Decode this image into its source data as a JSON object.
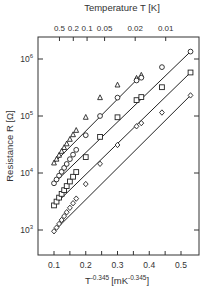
{
  "chart_data": {
    "type": "scatter",
    "title": "",
    "xlabel": "T^-0.345 [mK^-0.345]",
    "xlabel_base": "T",
    "xlabel_exp": "-0.345",
    "xlabel_unit_open": "[mK",
    "xlabel_unit_exp": "-0.345",
    "xlabel_unit_close": "]",
    "ylabel": "Resistance R [Ω]",
    "top_axis_label": "Temperature T [K]",
    "xlim": [
      0.08,
      0.56
    ],
    "ylim_log10": [
      2.52,
      6.37
    ],
    "yscale": "log",
    "x_ticks": [
      "0.1",
      "0.2",
      "0.3",
      "0.4",
      "0.5"
    ],
    "y_ticks": [
      {
        "base": "10",
        "exp": "3",
        "value": 1000
      },
      {
        "base": "10",
        "exp": "4",
        "value": 10000
      },
      {
        "base": "10",
        "exp": "5",
        "value": 100000
      },
      {
        "base": "10",
        "exp": "6",
        "value": 1000000
      }
    ],
    "top_ticks": [
      {
        "label": "0.5",
        "T": 0.5
      },
      {
        "label": "0.2",
        "T": 0.2
      },
      {
        "label": "0.1",
        "T": 0.1
      },
      {
        "label": "0.05",
        "T": 0.05
      },
      {
        "label": "0.02",
        "T": 0.02
      },
      {
        "label": "0.01",
        "T": 0.01
      }
    ],
    "series": [
      {
        "name": "triangle",
        "marker": "triangle",
        "x": [
          0.1,
          0.108,
          0.116,
          0.124,
          0.132,
          0.14,
          0.15,
          0.16,
          0.17,
          0.2,
          0.245,
          0.3,
          0.36,
          0.375
        ],
        "y": [
          15000,
          17500,
          20500,
          24000,
          28000,
          32500,
          39000,
          47000,
          56000,
          95000,
          210000,
          350000,
          460000,
          520000
        ]
      },
      {
        "name": "circle",
        "marker": "circle",
        "x": [
          0.1,
          0.108,
          0.116,
          0.124,
          0.132,
          0.14,
          0.15,
          0.16,
          0.17,
          0.2,
          0.245,
          0.3,
          0.36,
          0.375,
          0.44,
          0.53
        ],
        "y": [
          6600,
          7700,
          9000,
          10500,
          12300,
          14400,
          17500,
          21000,
          25500,
          46000,
          100000,
          210000,
          420000,
          470000,
          720000,
          1350000
        ]
      },
      {
        "name": "square",
        "marker": "square",
        "x": [
          0.1,
          0.108,
          0.116,
          0.124,
          0.132,
          0.14,
          0.15,
          0.16,
          0.17,
          0.2,
          0.245,
          0.3,
          0.36,
          0.375,
          0.44,
          0.53
        ],
        "y": [
          2700,
          3150,
          3700,
          4300,
          5000,
          5900,
          7100,
          8600,
          10400,
          19000,
          43000,
          95000,
          190000,
          215000,
          320000,
          580000
        ]
      },
      {
        "name": "diamond",
        "marker": "diamond",
        "x": [
          0.1,
          0.108,
          0.116,
          0.124,
          0.132,
          0.14,
          0.15,
          0.16,
          0.17,
          0.2,
          0.245,
          0.3,
          0.36,
          0.375,
          0.44,
          0.53
        ],
        "y": [
          950,
          1100,
          1280,
          1500,
          1750,
          2050,
          2450,
          2950,
          3550,
          6400,
          14500,
          31000,
          66000,
          75000,
          115000,
          230000
        ]
      }
    ],
    "grid": false,
    "legend": null
  }
}
